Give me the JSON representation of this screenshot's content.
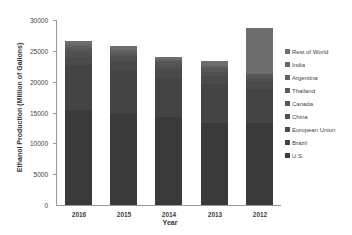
{
  "chart_data": {
    "type": "bar",
    "stacked": true,
    "title": "",
    "xlabel": "Year",
    "ylabel": "Ethanol Production (Million of Gallons)",
    "ylim": [
      0,
      30000
    ],
    "yticks": [
      "30000",
      "25000",
      "20000",
      "15000",
      "10000",
      "5000",
      "0"
    ],
    "categories": [
      "2016",
      "2015",
      "2014",
      "2013",
      "2012"
    ],
    "series": [
      {
        "name": "U.S.",
        "values": [
          15330,
          14810,
          14340,
          13310,
          13300
        ],
        "color": "#3a3a3a"
      },
      {
        "name": "Brazil",
        "values": [
          7300,
          7100,
          6190,
          6270,
          5580
        ],
        "color": "#444444"
      },
      {
        "name": "European Union",
        "values": [
          1380,
          1390,
          1450,
          1370,
          1180
        ],
        "color": "#4a4a4a"
      },
      {
        "name": "China",
        "values": [
          850,
          810,
          640,
          700,
          555
        ],
        "color": "#505050"
      },
      {
        "name": "Canada",
        "values": [
          436,
          436,
          510,
          523,
          449
        ],
        "color": "#565656"
      },
      {
        "name": "Thailand",
        "values": [
          322,
          334,
          310,
          291,
          185
        ],
        "color": "#5c5c5c"
      },
      {
        "name": "Argentina",
        "values": [
          264,
          211,
          160,
          132,
          68
        ],
        "color": "#626262"
      },
      {
        "name": "India",
        "values": [
          225,
          206,
          155,
          130,
          110
        ],
        "color": "#686868"
      },
      {
        "name": "Rest of World",
        "values": [
          492,
          560,
          245,
          600,
          7290
        ],
        "color": "#6e6e6e"
      }
    ],
    "totals": [
      26600,
      25900,
      24000,
      23300,
      28700
    ],
    "legend_position": "right",
    "grid": false
  },
  "legend": [
    "Rest of World",
    "India",
    "Argentina",
    "Thailand",
    "Canada",
    "China",
    "European Union",
    "Brazil",
    "U.S."
  ]
}
